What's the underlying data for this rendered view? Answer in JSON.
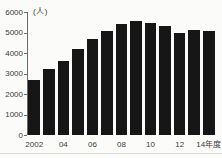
{
  "chart_data": {
    "type": "bar",
    "title": "",
    "xlabel": "",
    "ylabel": "(人)",
    "unit_label": "(人)",
    "categories": [
      "2002",
      "2003",
      "2004",
      "2005",
      "2006",
      "2007",
      "2008",
      "2009",
      "2010",
      "2011",
      "2012",
      "2013",
      "2014"
    ],
    "values": [
      2700,
      3200,
      3600,
      4200,
      4700,
      5050,
      5400,
      5550,
      5450,
      5300,
      5000,
      5100,
      5050
    ],
    "ylim": [
      0,
      6000
    ],
    "y_ticks": [
      "6000",
      "5000",
      "4000",
      "3000",
      "2000",
      "1000",
      "0"
    ],
    "x_tick_labels": [
      "2002",
      "04",
      "06",
      "08",
      "10",
      "12",
      "14年度"
    ],
    "grid": false,
    "legend": null,
    "colors": {
      "bar": "#161616",
      "axis": "#6a6a6a",
      "text": "#3b3b3b",
      "background": "#fbfbf9",
      "divider": "#d9d9d3"
    }
  }
}
